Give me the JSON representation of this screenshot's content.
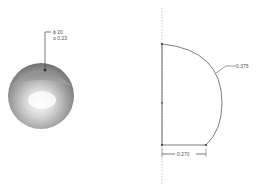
{
  "figure": {
    "left_view": {
      "type": "3d-sphere",
      "annotation": {
        "line1": "ϕ 20",
        "line2": "α 0.23"
      }
    },
    "right_view": {
      "type": "revolve-profile-sketch",
      "dimensions": {
        "arc_radius": "0.375",
        "base_width": "0.270"
      }
    }
  },
  "colors": {
    "line": "#444444",
    "axis": "#999999",
    "sphere_dark": "#7a7a7a",
    "sphere_light": "#f2f2f2"
  }
}
